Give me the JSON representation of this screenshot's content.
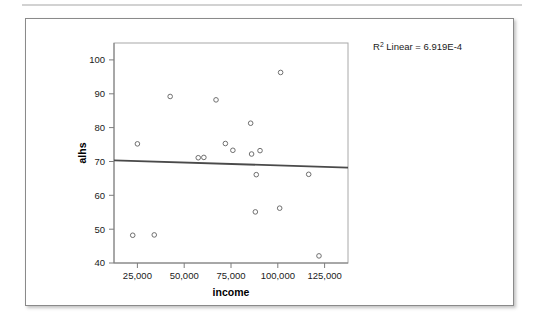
{
  "chart_data": {
    "type": "scatter",
    "title": "",
    "xlabel": "income",
    "ylabel": "alhs",
    "xlim": [
      12500,
      137500
    ],
    "ylim": [
      40,
      105
    ],
    "xticks": [
      25000,
      50000,
      75000,
      100000,
      125000
    ],
    "xtick_labels": [
      "25,000",
      "50,000",
      "75,000",
      "100,000",
      "125,000"
    ],
    "yticks": [
      40,
      50,
      60,
      70,
      80,
      90,
      100
    ],
    "ytick_labels": [
      "40",
      "50",
      "60",
      "70",
      "80",
      "90",
      "100"
    ],
    "grid": false,
    "legend": "none",
    "annotation": "R² Linear = 6.919E-4",
    "annotation_base": "R",
    "annotation_superscript": "2",
    "annotation_rest": " Linear = 6.919E-4",
    "marker_style": "open-circle",
    "marker_color": "#6f6f6f",
    "fit_line_color": "#4a4a4a",
    "points": [
      {
        "x": 25000,
        "y": 75.2
      },
      {
        "x": 22500,
        "y": 48.2
      },
      {
        "x": 34000,
        "y": 48.3
      },
      {
        "x": 42500,
        "y": 89.2
      },
      {
        "x": 57500,
        "y": 71.1
      },
      {
        "x": 60500,
        "y": 71.2
      },
      {
        "x": 67000,
        "y": 88.2
      },
      {
        "x": 72000,
        "y": 75.3
      },
      {
        "x": 76000,
        "y": 73.3
      },
      {
        "x": 85500,
        "y": 81.3
      },
      {
        "x": 86000,
        "y": 72.2
      },
      {
        "x": 88500,
        "y": 66.1
      },
      {
        "x": 88000,
        "y": 55.1
      },
      {
        "x": 90500,
        "y": 73.2
      },
      {
        "x": 101500,
        "y": 96.3
      },
      {
        "x": 101000,
        "y": 56.2
      },
      {
        "x": 116500,
        "y": 66.2
      },
      {
        "x": 122000,
        "y": 42.1
      }
    ],
    "fit_line": {
      "x_start": 12500,
      "y_start": 70.3,
      "x_end": 137500,
      "y_end": 68.2
    }
  }
}
